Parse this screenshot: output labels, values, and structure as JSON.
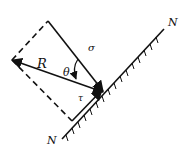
{
  "diagram": {
    "type": "stress-resolution",
    "labels": {
      "resultant": "R",
      "angle": "θ",
      "normal_stress": "σ",
      "shear_stress": "τ",
      "plane_top": "N",
      "plane_bottom": "N"
    },
    "colors": {
      "line": "#111111",
      "background": "#ffffff"
    }
  }
}
